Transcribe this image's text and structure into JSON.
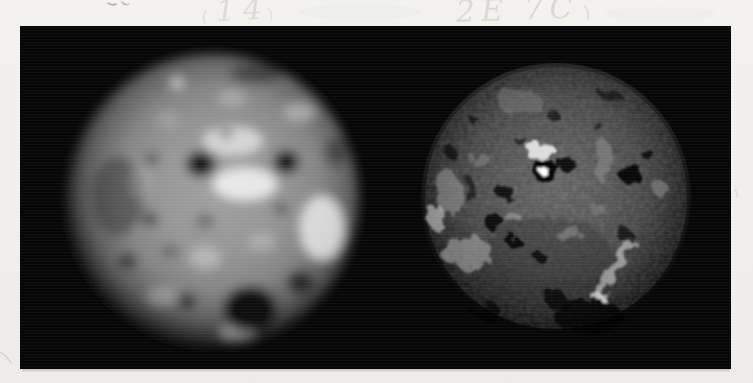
{
  "page": {
    "type": "scanned photograph print of two Io images",
    "paper_color": "#f1f0ec",
    "photo_background": "#060606"
  },
  "annotations": {
    "left_note": "14",
    "right_note": "2E 7C",
    "ink_color": "#d9d8d3"
  },
  "figure": {
    "left_image": {
      "name": "io-disk-blurred-telescope-view",
      "cx": 213,
      "cy": 200,
      "r": 146,
      "base_center_color": "#a2a2a2",
      "base_limb_color": "#0a0a0a",
      "features": [
        {
          "x": 118,
          "y": 196,
          "rx": 26,
          "ry": 40,
          "fill": "#2e2e2e",
          "op": 0.5
        },
        {
          "x": 256,
          "y": 74,
          "rx": 26,
          "ry": 10,
          "fill": "#1a1a1a",
          "op": 0.5
        },
        {
          "x": 336,
          "y": 152,
          "rx": 12,
          "ry": 14,
          "fill": "#222222",
          "op": 0.5
        },
        {
          "x": 233,
          "y": 141,
          "rx": 30,
          "ry": 14,
          "fill": "#f0f0f0",
          "op": 0.7
        },
        {
          "x": 245,
          "y": 184,
          "rx": 32,
          "ry": 16,
          "fill": "#f6f6f6",
          "op": 0.85
        },
        {
          "x": 322,
          "y": 228,
          "rx": 22,
          "ry": 32,
          "fill": "#efefef",
          "op": 0.8
        },
        {
          "x": 300,
          "y": 112,
          "rx": 16,
          "ry": 9,
          "fill": "#d9d9d9",
          "op": 0.5
        },
        {
          "x": 177,
          "y": 83,
          "rx": 6,
          "ry": 5,
          "fill": "#e8e8e8",
          "op": 0.8
        },
        {
          "x": 205,
          "y": 258,
          "rx": 16,
          "ry": 11,
          "fill": "#d9d9d9",
          "op": 0.5
        },
        {
          "x": 262,
          "y": 242,
          "rx": 13,
          "ry": 9,
          "fill": "#cfcfcf",
          "op": 0.45
        },
        {
          "x": 163,
          "y": 296,
          "rx": 16,
          "ry": 9,
          "fill": "#cccccc",
          "op": 0.4
        },
        {
          "x": 238,
          "y": 332,
          "rx": 18,
          "ry": 8,
          "fill": "#d6d6d6",
          "op": 0.5
        },
        {
          "x": 140,
          "y": 182,
          "rx": 11,
          "ry": 18,
          "fill": "#c5c5c5",
          "op": 0.3
        },
        {
          "x": 232,
          "y": 98,
          "rx": 14,
          "ry": 8,
          "fill": "#cfcfcf",
          "op": 0.45
        },
        {
          "x": 168,
          "y": 120,
          "rx": 12,
          "ry": 9,
          "fill": "#bdbdbd",
          "op": 0.35
        },
        {
          "x": 201,
          "y": 164,
          "rx": 15,
          "ry": 13,
          "fill": "#0b0b0b",
          "op": 0.9
        },
        {
          "x": 286,
          "y": 162,
          "rx": 13,
          "ry": 12,
          "fill": "#0b0b0b",
          "op": 0.92
        },
        {
          "x": 250,
          "y": 309,
          "rx": 27,
          "ry": 23,
          "fill": "#080808",
          "op": 0.92
        },
        {
          "x": 150,
          "y": 219,
          "rx": 8,
          "ry": 7,
          "fill": "#1c1c1c",
          "op": 0.65
        },
        {
          "x": 128,
          "y": 261,
          "rx": 9,
          "ry": 8,
          "fill": "#1c1c1c",
          "op": 0.65
        },
        {
          "x": 152,
          "y": 159,
          "rx": 7,
          "ry": 6,
          "fill": "#222222",
          "op": 0.55
        },
        {
          "x": 187,
          "y": 301,
          "rx": 9,
          "ry": 8,
          "fill": "#161616",
          "op": 0.7
        },
        {
          "x": 300,
          "y": 282,
          "rx": 13,
          "ry": 11,
          "fill": "#101010",
          "op": 0.75
        },
        {
          "x": 281,
          "y": 209,
          "rx": 7,
          "ry": 6,
          "fill": "#242424",
          "op": 0.55
        },
        {
          "x": 226,
          "y": 134,
          "rx": 6,
          "ry": 5,
          "fill": "#2a2a2a",
          "op": 0.55
        },
        {
          "x": 205,
          "y": 221,
          "rx": 10,
          "ry": 8,
          "fill": "#3a3a3a",
          "op": 0.4
        },
        {
          "x": 170,
          "y": 251,
          "rx": 8,
          "ry": 6,
          "fill": "#2a2a2a",
          "op": 0.45
        }
      ]
    },
    "right_image": {
      "name": "io-disk-detailed-spacecraft-view",
      "cx": 556,
      "cy": 198,
      "r": 135,
      "base_center_color": "#6a6a6a",
      "base_limb_color": "#040404",
      "features": [
        {
          "x": 545,
          "y": 262,
          "rx": 70,
          "ry": 45,
          "fill": "#2c2c2c",
          "op": 0.35
        },
        {
          "x": 520,
          "y": 102,
          "rx": 24,
          "ry": 10,
          "fill": "#7e7e7e",
          "op": 0.5
        },
        {
          "x": 448,
          "y": 192,
          "rx": 14,
          "ry": 22,
          "fill": "#9a9a9a",
          "op": 0.55
        },
        {
          "x": 466,
          "y": 252,
          "rx": 26,
          "ry": 16,
          "fill": "#a8a8a8",
          "op": 0.6
        },
        {
          "x": 437,
          "y": 218,
          "rx": 9,
          "ry": 13,
          "fill": "#c2c2c2",
          "op": 0.65
        },
        {
          "x": 604,
          "y": 162,
          "rx": 10,
          "ry": 22,
          "fill": "#8e8e8e",
          "op": 0.55
        },
        {
          "x": 660,
          "y": 188,
          "rx": 9,
          "ry": 7,
          "fill": "#8a8a8a",
          "op": 0.6
        },
        {
          "x": 568,
          "y": 233,
          "rx": 13,
          "ry": 7,
          "fill": "#9c9c9c",
          "op": 0.5
        },
        {
          "x": 513,
          "y": 217,
          "rx": 8,
          "ry": 5,
          "fill": "#b2b2b2",
          "op": 0.5
        },
        {
          "x": 480,
          "y": 160,
          "rx": 10,
          "ry": 6,
          "fill": "#8c8c8c",
          "op": 0.5
        },
        {
          "x": 598,
          "y": 210,
          "rx": 8,
          "ry": 5,
          "fill": "#888888",
          "op": 0.5
        },
        {
          "x": 541,
          "y": 152,
          "rx": 16,
          "ry": 8,
          "fill": "#eaeaea",
          "op": 0.9
        },
        {
          "x": 615,
          "y": 268,
          "rx": 7,
          "ry": 36,
          "rot": 28,
          "fill": "#bcbcbc",
          "op": 0.7
        },
        {
          "x": 597,
          "y": 297,
          "rx": 6,
          "ry": 4,
          "fill": "#d2d2d2",
          "op": 0.8
        },
        {
          "x": 566,
          "y": 166,
          "rx": 11,
          "ry": 5,
          "rot": -20,
          "fill": "#000000",
          "op": 0.85
        },
        {
          "x": 630,
          "y": 173,
          "rx": 12,
          "ry": 10,
          "fill": "#000000",
          "op": 0.9
        },
        {
          "x": 648,
          "y": 155,
          "rx": 6,
          "ry": 5,
          "fill": "#000000",
          "op": 0.75
        },
        {
          "x": 505,
          "y": 192,
          "rx": 9,
          "ry": 7,
          "fill": "#000000",
          "op": 0.8
        },
        {
          "x": 494,
          "y": 222,
          "rx": 11,
          "ry": 7,
          "fill": "#000000",
          "op": 0.85
        },
        {
          "x": 513,
          "y": 241,
          "rx": 7,
          "ry": 6,
          "fill": "#000000",
          "op": 0.8
        },
        {
          "x": 540,
          "y": 257,
          "rx": 6,
          "ry": 5,
          "fill": "#000000",
          "op": 0.7
        },
        {
          "x": 588,
          "y": 316,
          "rx": 34,
          "ry": 18,
          "fill": "#000000",
          "op": 0.8
        },
        {
          "x": 556,
          "y": 300,
          "rx": 12,
          "ry": 8,
          "fill": "#000000",
          "op": 0.65
        },
        {
          "x": 489,
          "y": 308,
          "rx": 9,
          "ry": 7,
          "fill": "#000000",
          "op": 0.65
        },
        {
          "x": 449,
          "y": 151,
          "rx": 6,
          "ry": 5,
          "fill": "#000000",
          "op": 0.65
        },
        {
          "x": 476,
          "y": 122,
          "rx": 5,
          "ry": 4,
          "fill": "#000000",
          "op": 0.6
        },
        {
          "x": 554,
          "y": 116,
          "rx": 6,
          "ry": 5,
          "fill": "#000000",
          "op": 0.6
        },
        {
          "x": 594,
          "y": 122,
          "rx": 5,
          "ry": 4,
          "fill": "#000000",
          "op": 0.6
        },
        {
          "x": 625,
          "y": 235,
          "rx": 8,
          "ry": 6,
          "fill": "#000000",
          "op": 0.65
        },
        {
          "x": 520,
          "y": 140,
          "rx": 6,
          "ry": 4,
          "fill": "#000000",
          "op": 0.55
        },
        {
          "x": 470,
          "y": 190,
          "rx": 5,
          "ry": 13,
          "fill": "#000000",
          "op": 0.5
        },
        {
          "x": 610,
          "y": 95,
          "rx": 10,
          "ry": 6,
          "fill": "#000000",
          "op": 0.55
        },
        {
          "x": 470,
          "y": 320,
          "rx": 28,
          "ry": 12,
          "fill": "#000000",
          "op": 0.7
        },
        {
          "x": 545,
          "y": 171,
          "rx": 13,
          "ry": 11,
          "fill": "#000000",
          "op": 0.95
        },
        {
          "x": 543,
          "y": 170,
          "rx": 5,
          "ry": 4,
          "fill": "#ffffff",
          "op": 1
        }
      ]
    }
  }
}
